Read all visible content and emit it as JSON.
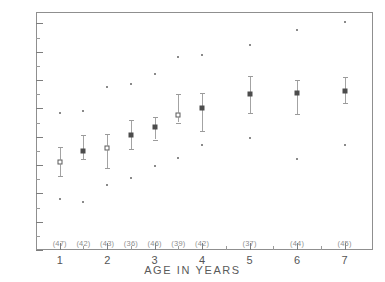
{
  "chart_data": {
    "type": "scatter",
    "title": "",
    "xlabel": "AGE IN YEARS",
    "ylabel": "",
    "xlim": [
      0.5,
      7.6
    ],
    "ylim": [
      0,
      168
    ],
    "grid": false,
    "legend": null,
    "y_ticks": [
      0,
      20,
      40,
      60,
      80,
      100,
      120,
      140,
      160
    ],
    "y_tick_labels": [
      "0",
      "20",
      "40",
      "60",
      "80",
      "100",
      "120",
      "140",
      "160"
    ],
    "y_minor_step": 10,
    "x_ticks": [
      1,
      2,
      3,
      4,
      5,
      6,
      7
    ],
    "x_tick_labels": [
      "1",
      "2",
      "3",
      "4",
      "5",
      "6",
      "7"
    ],
    "x_minor_ticks": [
      1.5,
      2.5,
      3.5,
      4.5,
      5.5,
      6.5
    ],
    "marker_note": "central marker = group mean; vertical bar = variability range; isolated dots = individual extreme observations",
    "groups": [
      {
        "x": 1,
        "n_label": "(47)",
        "n": 47,
        "mean": 62,
        "mean_style": "open",
        "bar_low": 52,
        "bar_high": 73,
        "outliers": [
          97,
          36
        ]
      },
      {
        "x": 1.5,
        "n_label": "(42)",
        "n": 42,
        "mean": 70,
        "mean_style": "filled",
        "bar_low": 64,
        "bar_high": 81,
        "outliers": [
          98,
          34
        ]
      },
      {
        "x": 2,
        "n_label": "(43)",
        "n": 43,
        "mean": 72,
        "mean_style": "open",
        "bar_low": 58,
        "bar_high": 82,
        "outliers": [
          115,
          46
        ]
      },
      {
        "x": 2.5,
        "n_label": "(36)",
        "n": 36,
        "mean": 81,
        "mean_style": "filled",
        "bar_low": 71,
        "bar_high": 92,
        "outliers": [
          117,
          51
        ]
      },
      {
        "x": 3,
        "n_label": "(46)",
        "n": 46,
        "mean": 87,
        "mean_style": "filled",
        "bar_low": 78,
        "bar_high": 94,
        "outliers": [
          124,
          59
        ]
      },
      {
        "x": 3.5,
        "n_label": "(39)",
        "n": 39,
        "mean": 95,
        "mean_style": "open",
        "bar_low": 90,
        "bar_high": 110,
        "outliers": [
          136,
          65
        ]
      },
      {
        "x": 4,
        "n_label": "(42)",
        "n": 42,
        "mean": 100,
        "mean_style": "filled",
        "bar_low": 84,
        "bar_high": 111,
        "outliers": [
          138,
          74
        ]
      },
      {
        "x": 5,
        "n_label": "(37)",
        "n": 37,
        "mean": 110,
        "mean_style": "filled",
        "bar_low": 97,
        "bar_high": 123,
        "outliers": [
          145,
          79
        ]
      },
      {
        "x": 6,
        "n_label": "(44)",
        "n": 44,
        "mean": 111,
        "mean_style": "filled",
        "bar_low": 96,
        "bar_high": 120,
        "outliers": [
          155,
          64
        ]
      },
      {
        "x": 7,
        "n_label": "(45)",
        "n": 45,
        "mean": 112,
        "mean_style": "filled",
        "bar_low": 104,
        "bar_high": 122,
        "outliers": [
          161,
          74
        ]
      }
    ]
  },
  "style": {
    "frame_color": "#8f8f8f",
    "marker_color": "#4c4c4c",
    "bar_color": "#a3a3a3",
    "text_color": "#555555"
  }
}
